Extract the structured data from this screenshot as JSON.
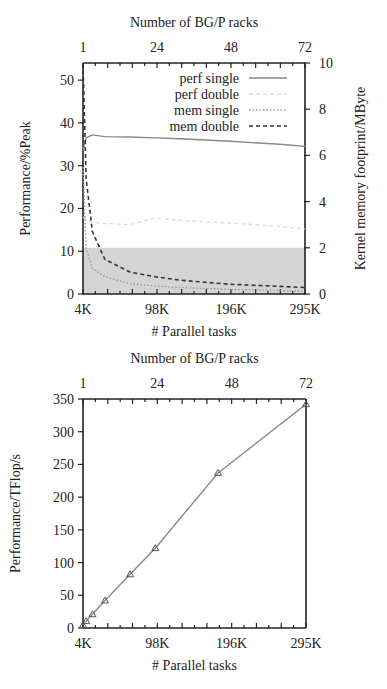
{
  "chart_data": [
    {
      "type": "line",
      "title": "",
      "xlabel": "# Parallel tasks",
      "x2label": "Number of BG/P racks",
      "ylabel": "Performance/%Peak",
      "y2label": "Kernel memory footprint/MByte",
      "x_ticks": [
        "4K",
        "98K",
        "196K",
        "295K"
      ],
      "x2_ticks": [
        "1",
        "24",
        "48",
        "72"
      ],
      "y_ticks": [
        "0",
        "10",
        "20",
        "30",
        "40",
        "50"
      ],
      "y2_ticks": [
        "0",
        "2",
        "4",
        "6",
        "8",
        "10"
      ],
      "xlim": [
        4096,
        294912
      ],
      "ylim": [
        0,
        54
      ],
      "y2lim": [
        0,
        10
      ],
      "grid": false,
      "legend_position": "upper right",
      "shaded_region": {
        "y2_from": 0,
        "y2_to": 2,
        "color": "#d4d4d4"
      },
      "x": [
        4096,
        8192,
        16384,
        32768,
        65536,
        98304,
        131072,
        196608,
        262144,
        294912
      ],
      "series": [
        {
          "name": "perf single",
          "axis": "left",
          "style": "solid",
          "color": "#888888",
          "values": [
            33.5,
            36.5,
            37.2,
            36.8,
            36.7,
            36.5,
            36.3,
            35.7,
            35.0,
            34.5
          ]
        },
        {
          "name": "perf double",
          "axis": "left",
          "style": "dashed",
          "color": "#dddddd",
          "values": [
            18,
            17.5,
            16.8,
            16.5,
            16.2,
            17.8,
            17.2,
            16.6,
            15.8,
            15.2
          ]
        },
        {
          "name": "mem single",
          "axis": "right",
          "style": "dotted",
          "color": "#999999",
          "values": [
            5.5,
            2.0,
            1.1,
            0.75,
            0.45,
            0.35,
            0.28,
            0.2,
            0.15,
            0.12
          ]
        },
        {
          "name": "mem double",
          "axis": "right",
          "style": "dashed",
          "color": "#333333",
          "values": [
            10,
            5.0,
            2.7,
            1.5,
            0.95,
            0.75,
            0.6,
            0.42,
            0.33,
            0.28
          ]
        }
      ]
    },
    {
      "type": "line",
      "title": "",
      "xlabel": "# Parallel tasks",
      "x2label": "Number of BG/P racks",
      "ylabel": "Performance/TFlop/s",
      "x_ticks": [
        "4K",
        "98K",
        "196K",
        "295K"
      ],
      "x2_ticks": [
        "1",
        "24",
        "48",
        "72"
      ],
      "y_ticks": [
        "0",
        "50",
        "100",
        "150",
        "200",
        "250",
        "300",
        "350"
      ],
      "xlim": [
        4096,
        294912
      ],
      "ylim": [
        0,
        350
      ],
      "grid": false,
      "marker": "triangle",
      "x": [
        4096,
        8192,
        16384,
        32768,
        65536,
        98304,
        180224,
        294912
      ],
      "series": [
        {
          "name": "Performance",
          "values": [
            4.7,
            10.5,
            21,
            42,
            82,
            122,
            237,
            342
          ],
          "color": "#888888"
        }
      ]
    }
  ]
}
